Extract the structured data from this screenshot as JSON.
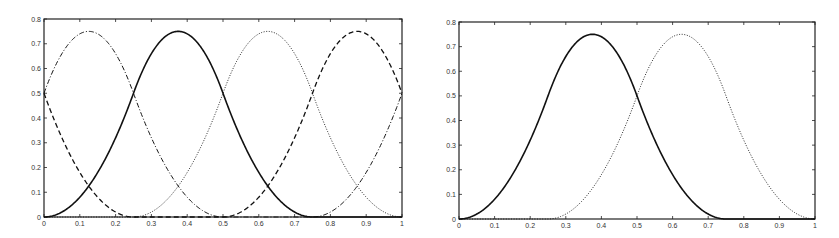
{
  "chart_data": [
    {
      "type": "line",
      "title": "",
      "xlabel": "",
      "ylabel": "",
      "xlim": [
        0,
        1
      ],
      "ylim": [
        0,
        0.8
      ],
      "grid": false,
      "legend": null,
      "x_ticks": [
        "0",
        "0.1",
        "0.2",
        "0.3",
        "0.4",
        "0.5",
        "0.6",
        "0.7",
        "0.8",
        "0.9",
        "1"
      ],
      "y_ticks": [
        "0",
        "0.1",
        "0.2",
        "0.3",
        "0.4",
        "0.5",
        "0.6",
        "0.7",
        "0.8"
      ],
      "frame": {
        "left": 44,
        "top": 19,
        "right": 402,
        "bottom": 217
      },
      "description": "Four periodic quadratic B-spline basis functions, knot spacing 0.25",
      "series": [
        {
          "name": "solid",
          "style": "solid",
          "width": 1.6,
          "center": 0.375,
          "periodic": true
        },
        {
          "name": "dash-dot",
          "style": "dashdot",
          "width": 1.0,
          "center": 0.125,
          "periodic": true
        },
        {
          "name": "dotted",
          "style": "dotted",
          "width": 0.9,
          "center": 0.625,
          "periodic": true
        },
        {
          "name": "dashed",
          "style": "dashed",
          "width": 1.3,
          "center": 0.875,
          "periodic": true
        }
      ],
      "sample_points": {
        "x": [
          0,
          0.125,
          0.25,
          0.375,
          0.5,
          0.625,
          0.75,
          0.875,
          1
        ],
        "solid": [
          0,
          0.125,
          0.5,
          0.75,
          0.5,
          0.125,
          0,
          0,
          0
        ],
        "dash-dot": [
          0.5,
          0.75,
          0.5,
          0.125,
          0,
          0,
          0,
          0.125,
          0.5
        ],
        "dotted": [
          0.5,
          0.125,
          0,
          0,
          0.125,
          0.5,
          0.75,
          0.5,
          0.125
        ],
        "dashed": [
          0,
          0,
          0.125,
          0.5,
          0.75,
          0.5,
          0.125,
          0,
          0
        ]
      }
    },
    {
      "type": "line",
      "title": "",
      "xlabel": "",
      "ylabel": "",
      "xlim": [
        0,
        1
      ],
      "ylim": [
        0,
        0.8
      ],
      "grid": false,
      "legend": null,
      "x_ticks": [
        "0",
        "0.1",
        "0.2",
        "0.3",
        "0.4",
        "0.5",
        "0.6",
        "0.7",
        "0.8",
        "0.9",
        "1"
      ],
      "y_ticks": [
        "0",
        "0.1",
        "0.2",
        "0.3",
        "0.4",
        "0.5",
        "0.6",
        "0.7",
        "0.8"
      ],
      "frame": {
        "left": 459,
        "top": 22,
        "right": 815,
        "bottom": 219
      },
      "description": "Two quadratic B-spline basis functions, supports [0,0.75] and [0.25,1]",
      "series": [
        {
          "name": "solid",
          "style": "solid",
          "width": 1.6,
          "center": 0.375,
          "periodic": false
        },
        {
          "name": "dotted",
          "style": "dotted",
          "width": 0.9,
          "center": 0.625,
          "periodic": false
        }
      ],
      "sample_points": {
        "x": [
          0,
          0.125,
          0.25,
          0.375,
          0.5,
          0.625,
          0.75,
          0.875,
          1
        ],
        "solid": [
          0,
          0.125,
          0.5,
          0.75,
          0.5,
          0.125,
          0,
          0,
          0
        ],
        "dotted": [
          0,
          0,
          0,
          0.125,
          0.5,
          0.75,
          0.5,
          0.125,
          0
        ]
      }
    }
  ]
}
